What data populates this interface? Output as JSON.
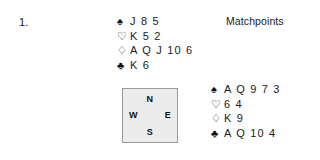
{
  "deal": {
    "number_label": "1.",
    "scoring_label": "Matchpoints"
  },
  "suits": {
    "spade_symbol": "♠",
    "heart_symbol": "♡",
    "diamond_symbol": "♢",
    "club_symbol": "♣"
  },
  "hands": {
    "north": {
      "position_name": "North",
      "spades": "J 8 5",
      "hearts": "K 5 2",
      "diamonds": "A Q J 10 6",
      "clubs": "K 6"
    },
    "east": {
      "position_name": "East",
      "spades": "A Q 9 7 3",
      "hearts": "6 4",
      "diamonds": "K 9",
      "clubs": "A Q 10 4"
    }
  },
  "compass": {
    "north": "N",
    "south": "S",
    "west": "W",
    "east": "E",
    "fill_color": "#ececec",
    "border_color": "#9a9a9a"
  }
}
